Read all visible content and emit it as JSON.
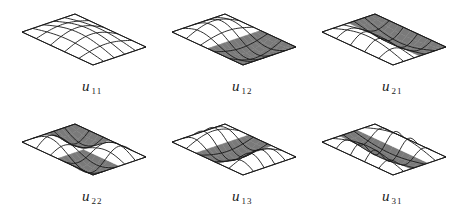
{
  "figure": {
    "colors": {
      "line": "#1a1a1a",
      "shade": "#7a7a7a",
      "background": "#ffffff"
    },
    "panels": [
      {
        "id": "u11",
        "symbol": "u",
        "subscript": "11",
        "shading": "none",
        "row": 0,
        "col": 0
      },
      {
        "id": "u12",
        "symbol": "u",
        "subscript": "12",
        "shading": "front-half",
        "row": 0,
        "col": 1
      },
      {
        "id": "u21",
        "symbol": "u",
        "subscript": "21",
        "shading": "right-half",
        "row": 0,
        "col": 2
      },
      {
        "id": "u22",
        "symbol": "u",
        "subscript": "22",
        "shading": "diagonal-quadrants",
        "row": 1,
        "col": 0
      },
      {
        "id": "u13",
        "symbol": "u",
        "subscript": "13",
        "shading": "middle-band-x",
        "row": 1,
        "col": 1
      },
      {
        "id": "u31",
        "symbol": "u",
        "subscript": "31",
        "shading": "middle-band-y",
        "row": 1,
        "col": 2
      }
    ]
  }
}
